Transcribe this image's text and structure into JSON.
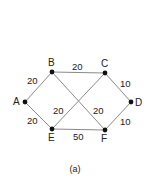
{
  "diagram": {
    "type": "weighted-undirected-graph",
    "caption": "(a)",
    "colors": {
      "edge": "#8a8a8a",
      "node": "#111111",
      "text": "#222222"
    },
    "nodes": [
      {
        "id": "A",
        "x": 25,
        "y": 102,
        "lx": 13,
        "ly": 105
      },
      {
        "id": "B",
        "x": 52,
        "y": 72,
        "lx": 48,
        "ly": 66
      },
      {
        "id": "C",
        "x": 105,
        "y": 73,
        "lx": 101,
        "ly": 67
      },
      {
        "id": "D",
        "x": 131,
        "y": 102,
        "lx": 135,
        "ly": 106
      },
      {
        "id": "E",
        "x": 52,
        "y": 129,
        "lx": 48,
        "ly": 141
      },
      {
        "id": "F",
        "x": 105,
        "y": 130,
        "lx": 101,
        "ly": 142
      }
    ],
    "edges": [
      {
        "from": "A",
        "to": "B",
        "weight": "20",
        "lx": 27,
        "ly": 84
      },
      {
        "from": "A",
        "to": "E",
        "weight": "20",
        "lx": 27,
        "ly": 124
      },
      {
        "from": "B",
        "to": "C",
        "weight": "20",
        "lx": 72,
        "ly": 70
      },
      {
        "from": "C",
        "to": "D",
        "weight": "10",
        "lx": 120,
        "ly": 87
      },
      {
        "from": "E",
        "to": "F",
        "weight": "50",
        "lx": 73,
        "ly": 140
      },
      {
        "from": "F",
        "to": "D",
        "weight": "10",
        "lx": 120,
        "ly": 125
      },
      {
        "from": "B",
        "to": "F",
        "weight": "20",
        "lx": 93,
        "ly": 114
      },
      {
        "from": "E",
        "to": "C",
        "weight": "20",
        "lx": 53,
        "ly": 114
      }
    ]
  }
}
